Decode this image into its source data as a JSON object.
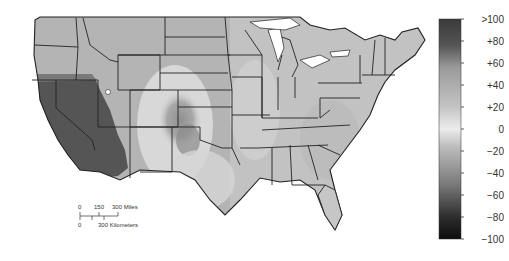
{
  "map": {
    "type": "choropleth-raster",
    "region": "Contiguous United States",
    "boundaries": "state lines",
    "colormap": "grayscale diverging (dark at extremes, light near 0)",
    "notable_regions": [
      {
        "name": "California / Nevada / western Arizona",
        "approx_value": ">100",
        "shade": "dark"
      },
      {
        "name": "Eastern Colorado / western Kansas / Oklahoma panhandle",
        "approx_value": "+40 to +60",
        "shade": "medium-dark"
      },
      {
        "name": "Remainder of CONUS",
        "approx_value": "+20 to +40",
        "shade": "light-medium"
      }
    ]
  },
  "colorbar": {
    "ticks": [
      ">100",
      "+80",
      "+60",
      "+40",
      "+20",
      "0",
      "−20",
      "−40",
      "−60",
      "−80",
      "−100"
    ],
    "range": [
      -100,
      100
    ]
  },
  "scale_bar": {
    "miles_labels": [
      "0",
      "150",
      "300 Miles"
    ],
    "km_labels": [
      "0",
      "300 Kilometers"
    ]
  }
}
